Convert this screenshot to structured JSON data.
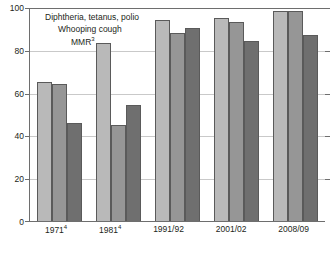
{
  "chart_data": {
    "type": "bar",
    "title": "",
    "subtitle": "",
    "xlabel": "",
    "ylabel": "",
    "ylim": [
      0,
      100
    ],
    "yticks": [
      0,
      20,
      40,
      60,
      80,
      100
    ],
    "ytick_labels": [
      "0",
      "20",
      "40",
      "60",
      "80",
      "100"
    ],
    "grid": true,
    "legend_position": "top-left",
    "categories": [
      "1971",
      "1981",
      "1991/92",
      "2001/02",
      "2008/09"
    ],
    "category_labels": [
      "1971⁴",
      "1981⁴",
      "1991/92",
      "2001/02",
      "2008/09"
    ],
    "category_footnotes": [
      "4",
      "4",
      "",
      "",
      ""
    ],
    "series": [
      {
        "name": "Diphtheria, tetanus, polio",
        "color": "#b9b9b9",
        "values": [
          65,
          83,
          94,
          95,
          98
        ]
      },
      {
        "name": "Whooping cough",
        "color": "#969696",
        "values": [
          64,
          45,
          88,
          93,
          98
        ]
      },
      {
        "name": "MMR",
        "footnote": "3",
        "color": "#6f6f6f",
        "values": [
          46,
          54,
          90,
          84,
          87
        ]
      }
    ]
  },
  "legend": {
    "items": [
      {
        "label": "Diphtheria, tetanus, polio",
        "sup": ""
      },
      {
        "label": "Whooping cough",
        "sup": ""
      },
      {
        "label": "MMR",
        "sup": "3"
      }
    ]
  },
  "axis": {
    "y_tick_labels": [
      "100",
      "80",
      "60",
      "40",
      "20",
      "0"
    ]
  }
}
